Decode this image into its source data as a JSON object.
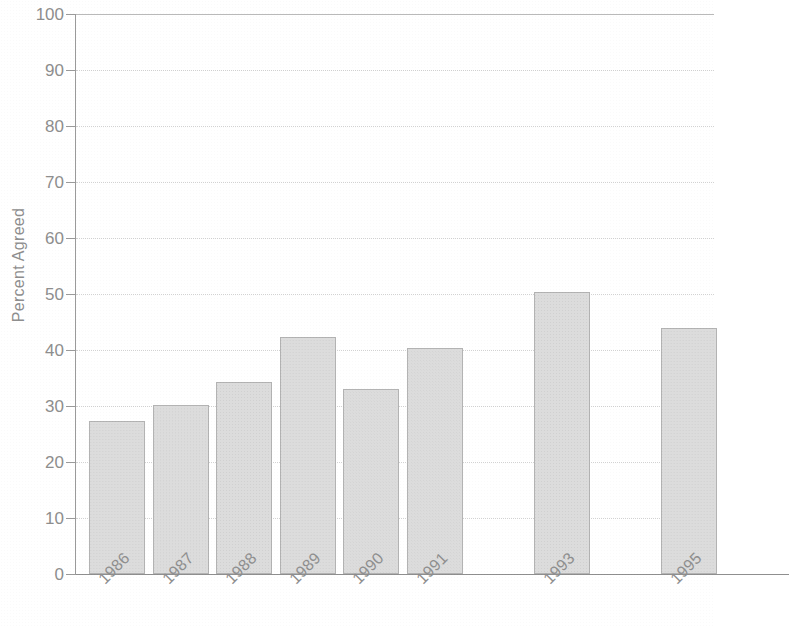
{
  "chart_data": {
    "type": "bar",
    "title": "",
    "subtitle": "",
    "xlabel": "",
    "ylabel": "Percent Agreed",
    "categories": [
      "1986",
      "1987",
      "1988",
      "1989",
      "1990",
      "1991",
      "1992",
      "1993",
      "1994",
      "1995"
    ],
    "values": [
      27.3,
      30.2,
      34.2,
      42.4,
      33.1,
      40.3,
      null,
      50.3,
      null,
      44.0
    ],
    "ylim": [
      0,
      100
    ],
    "y_ticks": [
      0,
      10,
      20,
      30,
      40,
      50,
      60,
      70,
      80,
      90,
      100
    ],
    "y_tick_labels": [
      "0",
      "10",
      "20",
      "30",
      "40",
      "50",
      "60",
      "70",
      "80",
      "90",
      "100"
    ],
    "missing_categories": [
      "1992",
      "1994"
    ],
    "grid": true,
    "grid_orientation": "horizontal",
    "grid_style": "dotted",
    "legend": false,
    "legend_position": "none",
    "bar_fill_color": "#dcdcdc",
    "bar_border_color": "#b3b3b3",
    "axis_color": "#9a9a9a",
    "text_color": "#8e8e8e",
    "background_color": "#ffffff",
    "x_label_rotation": -45,
    "series": [
      {
        "name": "Percent Agreed",
        "values": [
          27.3,
          30.2,
          34.2,
          42.4,
          33.1,
          40.3,
          null,
          50.3,
          null,
          44.0
        ]
      }
    ],
    "bars": [
      {
        "category": "1986",
        "value": 27.3
      },
      {
        "category": "1987",
        "value": 30.2
      },
      {
        "category": "1988",
        "value": 34.2
      },
      {
        "category": "1989",
        "value": 42.4
      },
      {
        "category": "1990",
        "value": 33.1
      },
      {
        "category": "1991",
        "value": 40.3
      },
      {
        "category": "1992",
        "value": null
      },
      {
        "category": "1993",
        "value": 50.3
      },
      {
        "category": "1994",
        "value": null
      },
      {
        "category": "1995",
        "value": 44.0
      }
    ]
  }
}
